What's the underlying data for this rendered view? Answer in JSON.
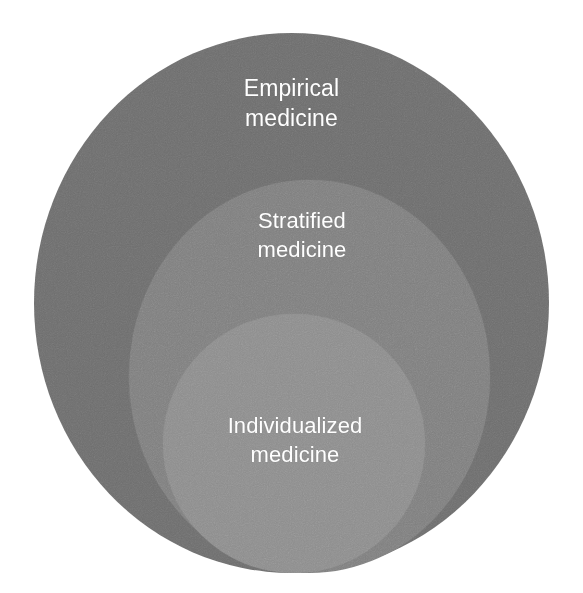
{
  "diagram": {
    "type": "nested-containment",
    "background_color": "#ffffff",
    "label_color": "#ffffff",
    "rings": [
      {
        "id": "empirical",
        "label": "Empirical\nmedicine",
        "label_line_1": "Empirical",
        "label_line_2": "medicine",
        "level": "outermost",
        "fill_color": "#6e6e6e"
      },
      {
        "id": "stratified",
        "label": "Stratified\nmedicine",
        "label_line_1": "Stratified",
        "label_line_2": "medicine",
        "level": "middle",
        "fill_color": "#7f7f7f"
      },
      {
        "id": "individualized",
        "label": "Individualized\nmedicine",
        "label_line_1": "Individualized",
        "label_line_2": "medicine",
        "level": "innermost",
        "fill_color": "#8d8d8d"
      }
    ]
  }
}
